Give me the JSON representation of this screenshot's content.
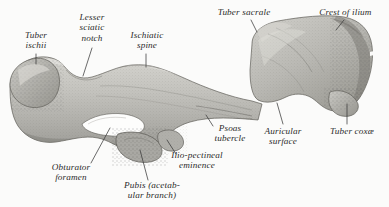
{
  "figure": {
    "specimen": "os-coxae",
    "background_color": "#fbfbfa",
    "bone_color": "#b9b8b4",
    "bone_shadow_color": "#8e8d88",
    "bone_highlight_color": "#d8d7d2",
    "foramen_color": "#fdfdfc",
    "label_color": "#2b2b2b",
    "leader_color": "#3a3a3a"
  },
  "labels": [
    {
      "id": "tuber-ischii",
      "lines": [
        "Tuber",
        "ischii"
      ],
      "x": 36,
      "y": 30,
      "align": "center",
      "leader": {
        "x1": 36,
        "y1": 54,
        "x2": 36,
        "y2": 64
      }
    },
    {
      "id": "lesser-sciatic-notch",
      "lines": [
        "Lesser",
        "sciatic",
        "notch"
      ],
      "x": 92,
      "y": 14,
      "align": "center",
      "leader": {
        "x1": 92,
        "y1": 48,
        "x2": 83,
        "y2": 76
      }
    },
    {
      "id": "ischiatic-spine",
      "lines": [
        "Ischiatic",
        "spine"
      ],
      "x": 146,
      "y": 30,
      "align": "center",
      "leader": {
        "x1": 146,
        "y1": 54,
        "x2": 146,
        "y2": 67
      }
    },
    {
      "id": "tuber-sacrale",
      "lines": [
        "Tuber sacrale"
      ],
      "x": 244,
      "y": 8,
      "align": "center",
      "leader": {
        "x1": 251,
        "y1": 20,
        "x2": 257,
        "y2": 32
      }
    },
    {
      "id": "crest-of-ilium",
      "lines": [
        "Crest of ilium"
      ],
      "x": 352,
      "y": 8,
      "align": "center",
      "leader": {
        "x1": 344,
        "y1": 20,
        "x2": 336,
        "y2": 30
      }
    },
    {
      "id": "psoas-tubercle",
      "lines": [
        "Psoas",
        "tubercle"
      ],
      "x": 230,
      "y": 127,
      "align": "center",
      "leader": {
        "x1": 213,
        "y1": 126,
        "x2": 206,
        "y2": 115
      }
    },
    {
      "id": "auricular-surface",
      "lines": [
        "Auricular",
        "surface"
      ],
      "x": 283,
      "y": 128,
      "align": "center",
      "leader": {
        "x1": 283,
        "y1": 124,
        "x2": 277,
        "y2": 103
      }
    },
    {
      "id": "tuber-coxae",
      "lines": [
        "Tuber coxæ"
      ],
      "x": 354,
      "y": 128,
      "align": "center",
      "leader": {
        "x1": 347,
        "y1": 124,
        "x2": 347,
        "y2": 104
      }
    },
    {
      "id": "obturator-foramen",
      "lines": [
        "Obturator",
        "foramen"
      ],
      "x": 71,
      "y": 164,
      "align": "center",
      "leader": {
        "x1": 91,
        "y1": 163,
        "x2": 110,
        "y2": 128
      }
    },
    {
      "id": "pubis-acetabular-branch",
      "lines": [
        "Pubis (acetab-",
        "ular branch)"
      ],
      "x": 152,
      "y": 182,
      "align": "center",
      "leader": {
        "x1": 148,
        "y1": 180,
        "x2": 140,
        "y2": 150
      }
    },
    {
      "id": "ilio-pectineal-eminence",
      "lines": [
        "Ilio-pectineal",
        "eminence"
      ],
      "x": 197,
      "y": 152,
      "align": "center",
      "leader": {
        "x1": 176,
        "y1": 154,
        "x2": 167,
        "y2": 140
      }
    }
  ]
}
